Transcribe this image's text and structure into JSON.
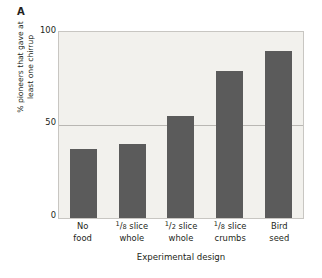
{
  "panel": {
    "label": "A"
  },
  "axes": {
    "ylabel_line1": "% pioneers that gave at",
    "ylabel_line2": "least one chirrup",
    "xlabel": "Experimental design",
    "ytick_top": "100",
    "ytick_mid": "50",
    "ytick_bottom": "0"
  },
  "colors": {
    "bar": "#5b5b5b",
    "plot_background": "#f2f1ed",
    "frame": "#c8c6c2",
    "gridline": "#b9b7b3",
    "text": "#231f20"
  },
  "xcats": [
    {
      "line1": "No",
      "line2": "food",
      "num": "",
      "den": ""
    },
    {
      "line1": "slice",
      "line2": "whole",
      "num": "1",
      "den": "8"
    },
    {
      "line1": "slice",
      "line2": "whole",
      "num": "1",
      "den": "2"
    },
    {
      "line1": "slice",
      "line2": "crumbs",
      "num": "1",
      "den": "8"
    },
    {
      "line1": "Bird",
      "line2": "seed",
      "num": "",
      "den": ""
    }
  ],
  "chart_data": {
    "type": "bar",
    "title": "A",
    "categories": [
      "No food",
      "1/8 slice whole",
      "1/2 slice whole",
      "1/8 slice crumbs",
      "Bird seed"
    ],
    "values": [
      37,
      40,
      55,
      79,
      90
    ],
    "xlabel": "Experimental design",
    "ylabel": "% pioneers that gave at least one chirrup",
    "ylim": [
      0,
      100
    ],
    "yticks": [
      0,
      50,
      100
    ],
    "grid": "horizontal gridline at y=50 only",
    "legend": "none",
    "bar_color": "#5b5b5b"
  }
}
